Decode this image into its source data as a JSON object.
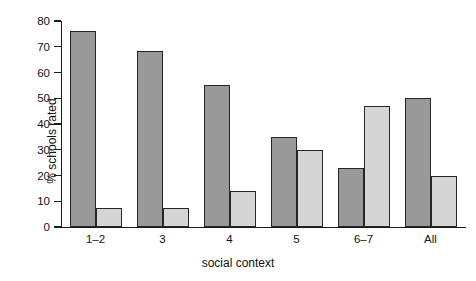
{
  "chart_data": {
    "type": "bar",
    "title": "",
    "xlabel": "social context",
    "ylabel": "% schools rated",
    "categories": [
      "1–2",
      "3",
      "4",
      "5",
      "6–7",
      "All"
    ],
    "series": [
      {
        "name": "series-1",
        "values": [
          76,
          68.5,
          55,
          35,
          23,
          50
        ],
        "color": "#999999"
      },
      {
        "name": "series-2",
        "values": [
          7.5,
          7.5,
          14,
          30,
          47,
          20
        ],
        "color": "#d5d5d5"
      }
    ],
    "ylim": [
      0,
      80
    ],
    "yticks": [
      0,
      10,
      20,
      30,
      40,
      50,
      60,
      70,
      80
    ],
    "ytick_labels": [
      "0",
      "10",
      "20",
      "30",
      "40",
      "50",
      "60",
      "70",
      "80"
    ],
    "grid": false,
    "legend": "none"
  },
  "axes": {
    "x_title": "social context",
    "y_title": "% schools rated"
  }
}
